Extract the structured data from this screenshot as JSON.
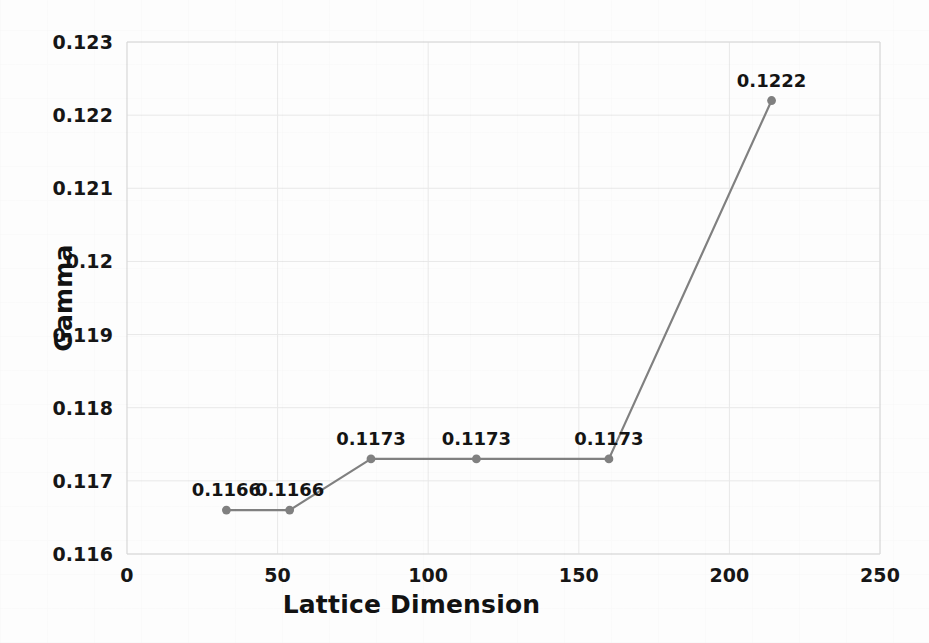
{
  "chart_data": {
    "type": "line",
    "title": "",
    "xlabel": "Lattice Dimension",
    "ylabel": "Gamma",
    "xlim": [
      0,
      250
    ],
    "ylim": [
      0.116,
      0.123
    ],
    "xticks": [
      0,
      50,
      100,
      150,
      200,
      250
    ],
    "xtick_labels": [
      "0",
      "50",
      "100",
      "150",
      "200",
      "250"
    ],
    "yticks": [
      0.116,
      0.117,
      0.118,
      0.119,
      0.12,
      0.121,
      0.122,
      0.123
    ],
    "ytick_labels": [
      "0.116",
      "0.117",
      "0.118",
      "0.119",
      "0.12",
      "0.121",
      "0.122",
      "0.123"
    ],
    "grid": true,
    "legend": "none",
    "series": [
      {
        "name": "Gamma",
        "color": "#808080",
        "marker": "circle",
        "x": [
          33,
          54,
          81,
          116,
          160,
          214
        ],
        "y": [
          0.1166,
          0.1166,
          0.1173,
          0.1173,
          0.1173,
          0.1222
        ],
        "point_labels": [
          "0.1166",
          "0.1166",
          "0.1173",
          "0.1173",
          "0.1173",
          "0.1222"
        ]
      }
    ]
  },
  "style": {
    "line_color": "#808080",
    "marker_color": "#808080",
    "grid_color": "#e8e8e8",
    "axis_color": "#d8d8d8",
    "text_color": "#141414",
    "background": "#fdfdfd"
  }
}
